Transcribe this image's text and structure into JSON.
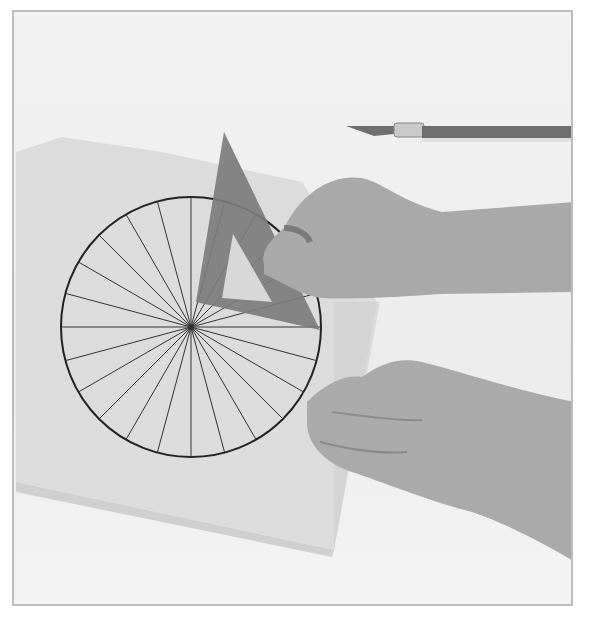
{
  "photo": {
    "subject": "hands using a set square to draw radial lines in a circle on card",
    "colors": {
      "background": "#efefef",
      "card": "#dedede",
      "set_square": "#7d7d7d",
      "skin": "#a8a8a8",
      "ink": "#222222",
      "border": "#bdbdbd",
      "knife_handle": "#6e6e6e"
    },
    "circle": {
      "cx": 189,
      "cy": 325,
      "r": 130,
      "spokes": 24
    }
  }
}
